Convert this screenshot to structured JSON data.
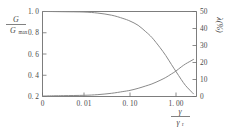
{
  "chart_data": {
    "type": "line",
    "title": "",
    "subtitle": "",
    "xlabel": "γ / γ_r",
    "xlabel_numerator": "γ",
    "xlabel_denominator": "γ",
    "xlabel_denominator_sub": "r",
    "ylabel_left_numerator": "G",
    "ylabel_left_denominator": "G",
    "ylabel_left_denominator_sub": "max",
    "ylabel_left": "G / G_max",
    "ylabel_right": "λ(%)",
    "x_tick_labels": [
      "0",
      "0. 01",
      "0. 10",
      "1. 00"
    ],
    "x_tick_values": [
      0,
      0.01,
      0.1,
      1.0
    ],
    "y_left_tick_labels": [
      "1. 0",
      "0. 8",
      "0. 6",
      "0. 4",
      "0. 2"
    ],
    "y_left_tick_values": [
      1.0,
      0.8,
      0.6,
      0.4,
      0.2
    ],
    "y_left_lim": [
      0.2,
      1.0
    ],
    "y_right_tick_labels": [
      "50",
      "40",
      "30",
      "20",
      "10",
      "0"
    ],
    "y_right_tick_values": [
      50,
      40,
      30,
      20,
      10,
      0
    ],
    "y_right_lim": [
      0,
      50
    ],
    "grid": false,
    "legend": false,
    "curve_color": "#8a8a8a",
    "axis_color": "#6e6e6e",
    "text_color": "#4a4a4a",
    "series": [
      {
        "name": "G/Gmax",
        "axis": "left",
        "x": [
          0,
          0.002,
          0.005,
          0.01,
          0.02,
          0.04,
          0.07,
          0.1,
          0.15,
          0.22,
          0.3,
          0.45,
          0.6,
          0.8,
          1.0,
          1.3,
          1.6,
          2.0,
          2.4
        ],
        "values": [
          1.0,
          1.0,
          0.998,
          0.995,
          0.985,
          0.965,
          0.935,
          0.91,
          0.87,
          0.81,
          0.755,
          0.66,
          0.585,
          0.5,
          0.435,
          0.36,
          0.305,
          0.26,
          0.225
        ]
      },
      {
        "name": "lambda",
        "axis": "right",
        "x": [
          0,
          0.002,
          0.005,
          0.01,
          0.02,
          0.04,
          0.07,
          0.1,
          0.15,
          0.22,
          0.3,
          0.45,
          0.6,
          0.8,
          1.0,
          1.3,
          1.6,
          2.0,
          2.4
        ],
        "values": [
          0.3,
          0.35,
          0.5,
          0.7,
          1.1,
          1.9,
          2.9,
          3.6,
          4.8,
          6.2,
          7.4,
          9.5,
          11.2,
          13.3,
          15.0,
          17.4,
          19.1,
          20.6,
          21.8
        ]
      }
    ],
    "annotations": []
  }
}
